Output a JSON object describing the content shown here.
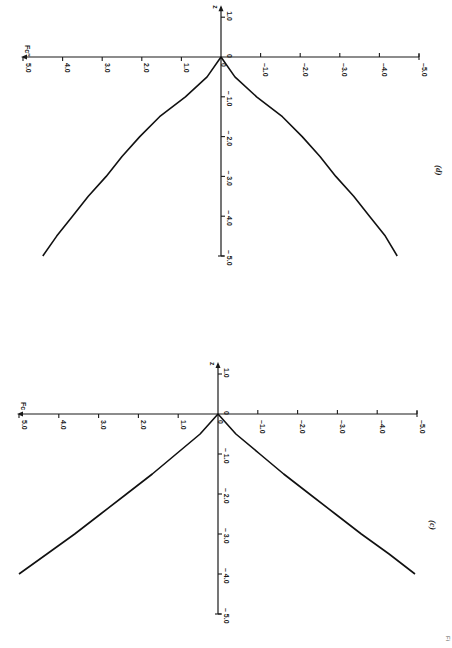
{
  "page": {
    "orientation": "rotated-90-clockwise",
    "figure_caption_fragment": "Fig. ..."
  },
  "chart_data": [
    {
      "id": "d",
      "panel_label": "(d)",
      "type": "line",
      "title": "",
      "xlabel": "z",
      "ylabel": "F_c''",
      "ylabel_display": "Fc″",
      "x_ticks": [
        "1.0",
        "0",
        "-1.0",
        "-2.0",
        "-3.0",
        "-4.0",
        "-5.0"
      ],
      "y_ticks": [
        "5.0",
        "4.0",
        "3.0",
        "2.0",
        "1.0",
        "0",
        "-1.0",
        "-2.0",
        "-3.0",
        "-4.0",
        "-5.0"
      ],
      "xlim": [
        -5.0,
        1.0
      ],
      "ylim": [
        -5.0,
        5.0
      ],
      "grid": false,
      "series": [
        {
          "name": "upper branch",
          "x": [
            0,
            -0.5,
            -1.0,
            -1.5,
            -2.0,
            -2.5,
            -3.0,
            -3.5,
            -4.0,
            -4.5,
            -5.0
          ],
          "y": [
            0,
            0.35,
            0.9,
            1.55,
            2.05,
            2.5,
            2.9,
            3.35,
            3.75,
            4.15,
            4.5
          ]
        },
        {
          "name": "lower branch",
          "x": [
            0,
            -0.5,
            -1.0,
            -1.5,
            -2.0,
            -2.5,
            -3.0,
            -3.5,
            -4.0,
            -4.5,
            -5.0
          ],
          "y": [
            0,
            -0.35,
            -0.9,
            -1.55,
            -2.05,
            -2.5,
            -2.9,
            -3.35,
            -3.75,
            -4.15,
            -4.45
          ]
        }
      ]
    },
    {
      "id": "c",
      "panel_label": "(c)",
      "type": "line",
      "title": "",
      "xlabel": "z",
      "ylabel": "F_c",
      "ylabel_display": "Fc",
      "x_ticks": [
        "1.0",
        "0",
        "-1.0",
        "-2.0",
        "-3.0",
        "-4.0",
        "-5.0"
      ],
      "y_ticks": [
        "5.0",
        "4.0",
        "3.0",
        "2.0",
        "1.0",
        "0",
        "-1.0",
        "-2.0",
        "-3.0",
        "-4.0",
        "-5.0"
      ],
      "xlim": [
        -5.0,
        1.0
      ],
      "ylim": [
        -5.0,
        5.0
      ],
      "grid": false,
      "series": [
        {
          "name": "upper branch",
          "x": [
            0,
            -0.5,
            -1.0,
            -1.5,
            -2.0,
            -2.5,
            -3.0,
            -3.5,
            -4.0
          ],
          "y": [
            0,
            0.45,
            1.05,
            1.65,
            2.3,
            2.95,
            3.6,
            4.3,
            5.0
          ]
        },
        {
          "name": "lower branch",
          "x": [
            0,
            -0.5,
            -1.0,
            -1.5,
            -2.0,
            -2.5,
            -3.0,
            -3.5,
            -4.0
          ],
          "y": [
            0,
            -0.45,
            -1.05,
            -1.65,
            -2.3,
            -2.95,
            -3.6,
            -4.3,
            -4.95
          ]
        }
      ]
    }
  ],
  "labels": {
    "d_yaxis": "Fc″",
    "c_yaxis": "Fc",
    "zaxis": "z",
    "panel_d": "(d)",
    "panel_c": "(c)",
    "fig_frag": "Fi"
  }
}
